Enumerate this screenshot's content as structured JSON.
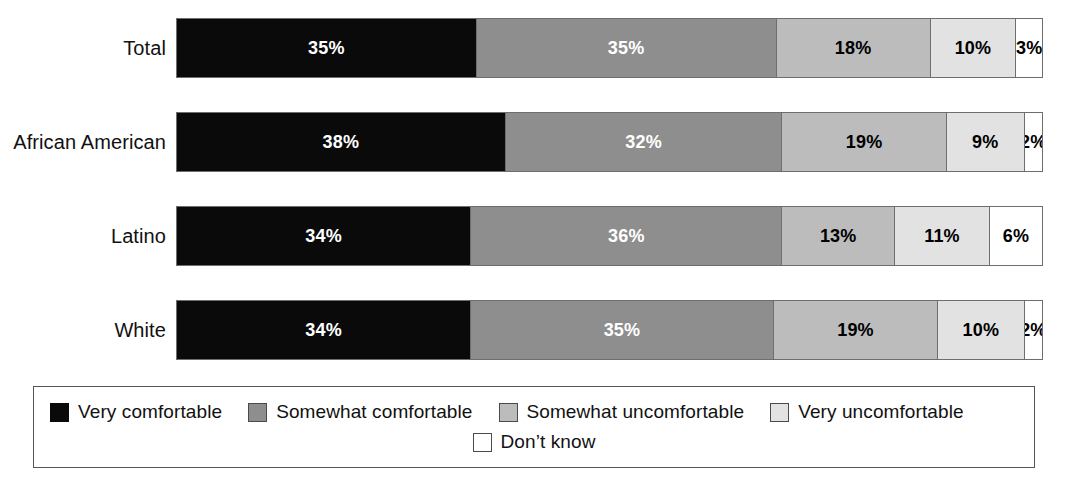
{
  "chart_data": {
    "type": "bar",
    "subtype": "stacked-horizontal-100pct",
    "title": "",
    "xlabel": "",
    "ylabel": "",
    "xlim": [
      0,
      100
    ],
    "grid": false,
    "legend_position": "bottom",
    "categories": [
      "Total",
      "African American",
      "Latino",
      "White"
    ],
    "series": [
      {
        "name": "Very comfortable",
        "color": "#0a0a0a",
        "values": [
          35,
          38,
          34,
          34
        ]
      },
      {
        "name": "Somewhat comfortable",
        "color": "#8e8e8e",
        "values": [
          35,
          32,
          36,
          35
        ]
      },
      {
        "name": "Somewhat uncomfortable",
        "color": "#bcbcbc",
        "values": [
          18,
          19,
          13,
          19
        ]
      },
      {
        "name": "Very uncomfortable",
        "color": "#e2e2e2",
        "values": [
          10,
          9,
          11,
          10
        ]
      },
      {
        "name": "Don’t know",
        "color": "#ffffff",
        "values": [
          3,
          2,
          6,
          2
        ]
      }
    ],
    "value_labels": [
      [
        "35%",
        "35%",
        "18%",
        "10%",
        "3%"
      ],
      [
        "38%",
        "32%",
        "19%",
        "9%",
        "2%"
      ],
      [
        "34%",
        "36%",
        "13%",
        "11%",
        "6%"
      ],
      [
        "34%",
        "35%",
        "19%",
        "10%",
        "2%"
      ]
    ]
  },
  "rows": [
    {
      "label": "Total",
      "segments": [
        {
          "label": "35%",
          "value": 35,
          "series": "Very comfortable"
        },
        {
          "label": "35%",
          "value": 35,
          "series": "Somewhat comfortable"
        },
        {
          "label": "18%",
          "value": 18,
          "series": "Somewhat uncomfortable"
        },
        {
          "label": "10%",
          "value": 10,
          "series": "Very uncomfortable"
        },
        {
          "label": "3%",
          "value": 3,
          "series": "Don’t know"
        }
      ]
    },
    {
      "label": "African American",
      "segments": [
        {
          "label": "38%",
          "value": 38,
          "series": "Very comfortable"
        },
        {
          "label": "32%",
          "value": 32,
          "series": "Somewhat comfortable"
        },
        {
          "label": "19%",
          "value": 19,
          "series": "Somewhat uncomfortable"
        },
        {
          "label": "9%",
          "value": 9,
          "series": "Very uncomfortable"
        },
        {
          "label": "2%",
          "value": 2,
          "series": "Don’t know"
        }
      ]
    },
    {
      "label": "Latino",
      "segments": [
        {
          "label": "34%",
          "value": 34,
          "series": "Very comfortable"
        },
        {
          "label": "36%",
          "value": 36,
          "series": "Somewhat comfortable"
        },
        {
          "label": "13%",
          "value": 13,
          "series": "Somewhat uncomfortable"
        },
        {
          "label": "11%",
          "value": 11,
          "series": "Very uncomfortable"
        },
        {
          "label": "6%",
          "value": 6,
          "series": "Don’t know"
        }
      ]
    },
    {
      "label": "White",
      "segments": [
        {
          "label": "34%",
          "value": 34,
          "series": "Very comfortable"
        },
        {
          "label": "35%",
          "value": 35,
          "series": "Somewhat comfortable"
        },
        {
          "label": "19%",
          "value": 19,
          "series": "Somewhat uncomfortable"
        },
        {
          "label": "10%",
          "value": 10,
          "series": "Very uncomfortable"
        },
        {
          "label": "2%",
          "value": 2,
          "series": "Don’t know"
        }
      ]
    }
  ],
  "legend": {
    "line1": [
      {
        "label": "Very comfortable",
        "color": "#0a0a0a"
      },
      {
        "label": "Somewhat comfortable",
        "color": "#8e8e8e"
      },
      {
        "label": "Somewhat uncomfortable",
        "color": "#bcbcbc"
      },
      {
        "label": "Very uncomfortable",
        "color": "#e2e2e2"
      }
    ],
    "line2": [
      {
        "label": "Don’t know",
        "color": "#ffffff"
      }
    ]
  },
  "colors": {
    "very_comfortable": "#0a0a0a",
    "somewhat_comfortable": "#8e8e8e",
    "somewhat_uncomfortable": "#bcbcbc",
    "very_uncomfortable": "#e2e2e2",
    "dont_know": "#ffffff",
    "outline": "#6e6e6e",
    "background": "#ffffff"
  }
}
